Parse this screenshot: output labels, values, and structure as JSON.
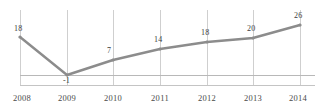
{
  "chart_data": {
    "type": "line",
    "title": "",
    "subtitle": "",
    "xlabel": "",
    "ylabel": "",
    "categories": [
      "2008",
      "2009",
      "2010",
      "2011",
      "2012",
      "2013",
      "2014"
    ],
    "values": [
      18,
      -1,
      7,
      14,
      18,
      20,
      26
    ],
    "point_labels": [
      "18",
      "-1",
      "7",
      "14",
      "18",
      "20",
      "26"
    ],
    "series": [
      {
        "name": "",
        "values": [
          18,
          -1,
          7,
          14,
          18,
          20,
          26
        ]
      }
    ],
    "ylim": [
      -4,
      30
    ],
    "xlim": [
      "2008",
      "2014"
    ],
    "grid": "vertical-only",
    "zero_line": 0,
    "legend": "none",
    "legend_position": "none",
    "colors": {
      "line": "#8c8c8c",
      "marker": "#8c8c8c",
      "gridline": "#cfcfcf",
      "zero_line": "#b8b8b8",
      "axis_line": "#c4c4c4",
      "label_text": "#3d3d3d",
      "tick_text": "#4a4a4a",
      "background": "#ffffff"
    },
    "geometry": {
      "point_x": [
        20,
        67,
        113,
        160,
        207,
        253,
        300
      ],
      "point_y": [
        37,
        75,
        60,
        49,
        42,
        38,
        25
      ],
      "zero_line_y": 75,
      "axis_bottom_y": 85,
      "gridline_top_y": 10,
      "label_offsets": [
        {
          "x": 14,
          "y": 25
        },
        {
          "x": 63,
          "y": 77
        },
        {
          "x": 107,
          "y": 47
        },
        {
          "x": 154,
          "y": 36
        },
        {
          "x": 201,
          "y": 29
        },
        {
          "x": 247,
          "y": 25
        },
        {
          "x": 294,
          "y": 12
        }
      ]
    }
  }
}
